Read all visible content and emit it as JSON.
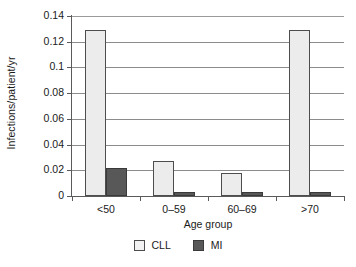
{
  "chart_data": {
    "type": "bar",
    "title": "",
    "subtitle": "",
    "xlabel": "Age group",
    "ylabel": "Infections/patient/yr",
    "categories": [
      "<50",
      "0–59",
      "60–69",
      ">70"
    ],
    "series": [
      {
        "name": "CLL",
        "color": "#ececec",
        "values": [
          0.129,
          0.027,
          0.018,
          0.129
        ]
      },
      {
        "name": "MI",
        "color": "#585858",
        "values": [
          0.0215,
          0.003,
          0.0035,
          0.0035
        ]
      }
    ],
    "ylim": [
      0,
      0.14
    ],
    "ytick_values": [
      0,
      0.02,
      0.04,
      0.06,
      0.08,
      0.1,
      0.12,
      0.14
    ],
    "ytick_labels": [
      "0",
      "0.02",
      "0.04",
      "0.06",
      "0.08",
      "0.1",
      "0.12",
      "0.14"
    ],
    "grid": "horizontal",
    "legend_position": "bottom-center",
    "legend_entries": [
      "CLL",
      "MI"
    ]
  }
}
